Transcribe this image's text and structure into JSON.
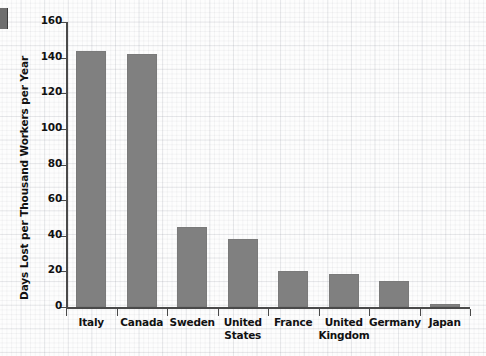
{
  "chart_data": {
    "type": "bar",
    "title": "",
    "xlabel": "",
    "ylabel": "Days Lost per Thousand Workers per Year",
    "categories": [
      "Italy",
      "Canada",
      "Sweden",
      "United States",
      "France",
      "United Kingdom",
      "Germany",
      "Japan"
    ],
    "category_lines": [
      [
        "Italy"
      ],
      [
        "Canada"
      ],
      [
        "Sweden"
      ],
      [
        "United",
        "States"
      ],
      [
        "France"
      ],
      [
        "United",
        "Kingdom"
      ],
      [
        "Germany"
      ],
      [
        "Japan"
      ]
    ],
    "values": [
      144,
      142,
      45,
      38,
      20,
      18.5,
      14.5,
      1.5
    ],
    "ylim": [
      0,
      160
    ],
    "yticks": [
      0,
      20,
      40,
      60,
      80,
      100,
      120,
      140,
      160
    ],
    "ytick_labels": [
      "0",
      "20",
      "40",
      "60",
      "80",
      "100",
      "120",
      "140",
      "160"
    ],
    "grid": "background-grid-paper",
    "legend": "none",
    "bar_color": "#808080",
    "axis_color": "#4a4a4a",
    "text_color": "#111111",
    "background_color": "#fdfdfd"
  }
}
